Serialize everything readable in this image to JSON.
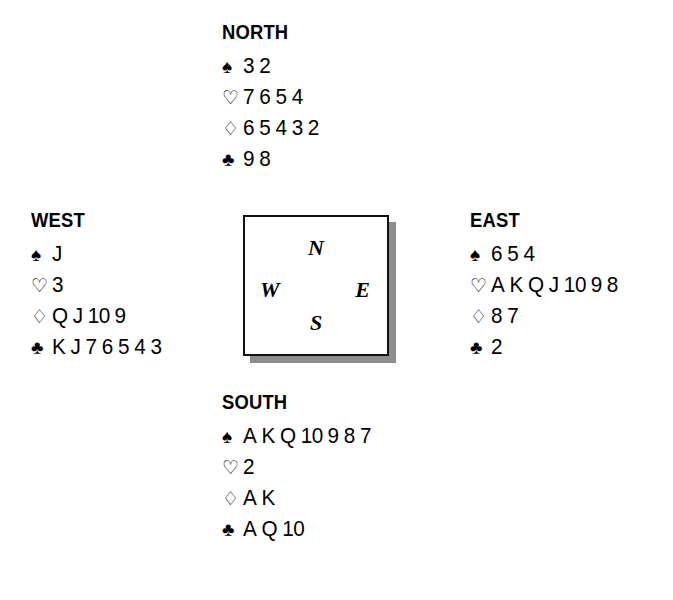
{
  "diagram": {
    "type": "bridge-hand-diagram",
    "compass": {
      "north": "N",
      "east": "E",
      "south": "S",
      "west": "W"
    },
    "suit_symbols": {
      "spade": "♠",
      "heart": "♡",
      "diamond": "♢",
      "club": "♣"
    },
    "hands": {
      "north": {
        "label": "NORTH",
        "spades": [
          "3",
          "2"
        ],
        "hearts": [
          "7",
          "6",
          "5",
          "4"
        ],
        "diamonds": [
          "6",
          "5",
          "4",
          "3",
          "2"
        ],
        "clubs": [
          "9",
          "8"
        ]
      },
      "west": {
        "label": "WEST",
        "spades": [
          "J"
        ],
        "hearts": [
          "3"
        ],
        "diamonds": [
          "Q",
          "J",
          "10",
          "9"
        ],
        "clubs": [
          "K",
          "J",
          "7",
          "6",
          "5",
          "4",
          "3"
        ]
      },
      "east": {
        "label": "EAST",
        "spades": [
          "6",
          "5",
          "4"
        ],
        "hearts": [
          "A",
          "K",
          "Q",
          "J",
          "10",
          "9",
          "8"
        ],
        "diamonds": [
          "8",
          "7"
        ],
        "clubs": [
          "2"
        ]
      },
      "south": {
        "label": "SOUTH",
        "spades": [
          "A",
          "K",
          "Q",
          "10",
          "9",
          "8",
          "7"
        ],
        "hearts": [
          "2"
        ],
        "diamonds": [
          "A",
          "K"
        ],
        "clubs": [
          "A",
          "Q",
          "10"
        ]
      }
    }
  }
}
